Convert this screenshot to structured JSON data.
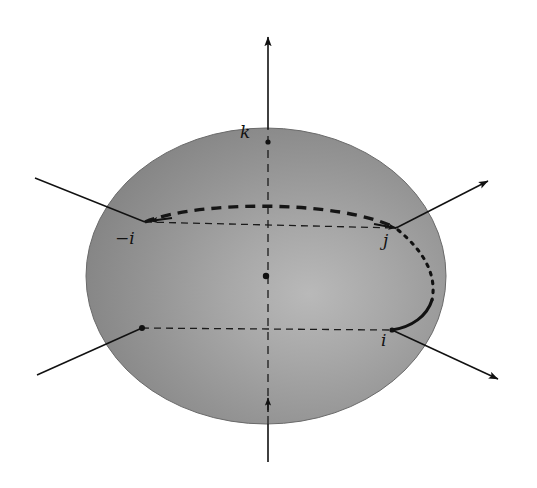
{
  "figure": {
    "background_color": "#ffffff",
    "width": 537,
    "height": 488
  },
  "sphere": {
    "name": "shaded-sphere",
    "center": {
      "x": 266,
      "y": 276
    },
    "radius_x": 180,
    "radius_y": 148,
    "fill_base_color": "#8e8e8e",
    "highlight_color": "#b5b5b5",
    "shadow_color": "#6f6f6f",
    "edge_color": "#5c5c5c"
  },
  "axes": [
    {
      "name": "k-axis-vertical",
      "label": "k",
      "label_position": {
        "x": 243,
        "y": 126
      },
      "from": {
        "x": 268,
        "y": 462
      },
      "to": {
        "x": 268,
        "y": 33
      },
      "style": "solid-with-arrow",
      "color": "#111111"
    },
    {
      "name": "j-axis-diagonal",
      "label": "j",
      "label_position": {
        "x": 385,
        "y": 234
      },
      "from": {
        "x": 35,
        "y": 178
      },
      "to": {
        "x": 492,
        "y": 179
      },
      "style": "solid-with-arrow",
      "color": "#111111"
    },
    {
      "name": "i-axis-diagonal",
      "label": "i",
      "label_position": {
        "x": 382,
        "y": 334
      },
      "from": {
        "x": 37,
        "y": 375
      },
      "to": {
        "x": 502,
        "y": 381
      },
      "style": "solid-with-arrow",
      "color": "#111111"
    }
  ],
  "points": [
    {
      "name": "point-minus-i",
      "label": "−i",
      "label_position": {
        "x": 118,
        "y": 232
      },
      "position": {
        "x": 145,
        "y": 222
      }
    },
    {
      "name": "point-j",
      "label": "j",
      "label_position": {
        "x": 385,
        "y": 234
      },
      "position": {
        "x": 396,
        "y": 228
      }
    },
    {
      "name": "point-i",
      "label": "i",
      "label_position": {
        "x": 382,
        "y": 334
      },
      "position": {
        "x": 392,
        "y": 330
      }
    },
    {
      "name": "point-center",
      "label": "",
      "label_position": {
        "x": 266,
        "y": 276
      },
      "position": {
        "x": 266,
        "y": 276
      }
    },
    {
      "name": "point-minus-j",
      "label": "",
      "label_position": {
        "x": 142,
        "y": 328
      },
      "position": {
        "x": 142,
        "y": 328
      }
    }
  ],
  "curves": [
    {
      "name": "great-circle-dashed-arc",
      "description": "thick dashed arc from minus-i over the top to j",
      "style": "thick-dashed",
      "dash_pattern": "9 7",
      "stroke_width": 3.2,
      "color": "#151515"
    },
    {
      "name": "geodesic-arc-j-to-i",
      "description": "arc bulging right from j down to i, dotted near j becoming solid near i",
      "style": "dotted-to-solid",
      "stroke_width": 3.0,
      "color": "#111111"
    },
    {
      "name": "equator-hidden-dashed",
      "description": "thin dashed diameters through the sphere centre",
      "style": "thin-dashed",
      "dash_pattern": "7 5",
      "stroke_width": 1.2,
      "color": "#1b1b1b"
    }
  ],
  "labels": {
    "k": "k",
    "minus_i": "−i",
    "j": "j",
    "i": "i"
  }
}
